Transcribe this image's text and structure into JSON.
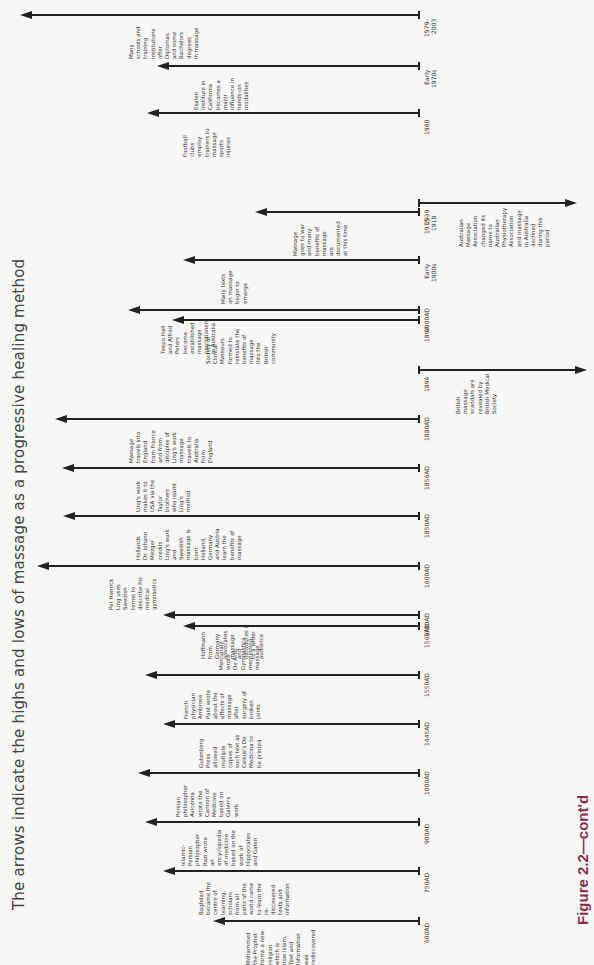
{
  "title": "The arrows indicate the highs and lows of massage as a progressive healing method",
  "figure_label": "Figure 2.2—cont'd",
  "events": [
    {
      "date": "1979–\n2003",
      "direction": "high",
      "y": 15,
      "tip": 20,
      "text": "Many\nschools and\ntraining\ninstitutions\noffer\nDiplomas\nand some\nBachelors\ndegrees\nin massage",
      "nx": 128
    },
    {
      "date": "Early\n1970s",
      "direction": "high",
      "y": 66,
      "tip": 157,
      "text": "Esalen\nInstitute in\nCalifornia\nbecomes a\nmajor\ninfluence in\nhands-on\nmodalities",
      "nx": 193
    },
    {
      "date": "1960",
      "direction": "high",
      "y": 113,
      "tip": 147,
      "text": "Football\nclubs\nemploy\ntrainers to\nmassage\nsports\ninjuries",
      "nx": 182
    },
    {
      "date": "1939",
      "direction": "low",
      "y": 203,
      "tip": 575,
      "text": "Australian\nMassage\nAssociation\nchanged its\nname to\nAustralian\nPhysiotherapy\nAssociation\nand massage\nin Australia\ndeclined\nduring this\nperiod",
      "nx": 458
    },
    {
      "date": "1915–\n1918",
      "direction": "high",
      "y": 212,
      "tip": 255,
      "text": "Massage\ngoes to war\nand many\nbenefits of\nmassage\nare\ndocumented\nat this time",
      "nx": 292
    },
    {
      "date": "Early\n1900s",
      "direction": "high",
      "y": 260,
      "tip": 183,
      "text": "Many texts\non massage\nbegin to\nemerge",
      "nx": 220
    },
    {
      "date": "1900AD",
      "direction": "high",
      "y": 310,
      "tip": 128,
      "text": "Teepo Hall\nand Alfred\nPeters\nbecome\nestablished\nmassage\npractitioners\nin Australia",
      "nx": 160
    },
    {
      "date": "1894",
      "direction": "high",
      "y": 320,
      "tip": 172,
      "text": "Society of\nClinical\nMasseurs\nformed to\nreinstate the\nbenefits of\nmassage\ninto the\nBritish\ncommunity",
      "nx": 205
    },
    {
      "date": "1894",
      "direction": "low",
      "y": 370,
      "tip": 585,
      "text": "British\nmassage\nscandals are\nrevealed by\nBritish Medical\nSociety",
      "nx": 455
    },
    {
      "date": "1880AD",
      "direction": "high",
      "y": 419,
      "tip": 55,
      "text": "Massage\ntravels into\nEngland\nfrom France\nand from\ndisciples of\nLing's work\nmassage\ntravels to\nAustralia\nfrom\nEngland",
      "nx": 128
    },
    {
      "date": "1856AD",
      "direction": "high",
      "y": 468,
      "tip": 62,
      "text": "Ling's work\nmakes it to\nUSA via the\nTaylor\nbrothers\nwho learnt\nLing's\nmethod",
      "nx": 135
    },
    {
      "date": "1850AD",
      "direction": "high",
      "y": 516,
      "tip": 63,
      "text": "Hollands\nDr. Johann\nMezger\ncredits\nLing's work\nand\nSwedish\nmassage is\nborn.\nHolland,\nGermany\nand Austria\nlearn the\nbenefits of\nmassage",
      "nx": 135
    },
    {
      "date": "1600AD",
      "direction": "high",
      "y": 566,
      "tip": 37,
      "text": "Per Henrick\nLing uses\nSwedish\nterms to\ndescribe his\nmedical\ngymnastics",
      "nx": 108
    },
    {
      "date": "1700AD",
      "direction": "high",
      "y": 615,
      "tip": 163,
      "text": "Hoffmann\nfrom\nGermany\nadvocates\nmassage\nand\nintroduces it\nto a wider\naudience",
      "nx": 200
    },
    {
      "date": "1569AD",
      "direction": "high",
      "y": 626,
      "tip": 183,
      "text": "Mercuriale\nwrote\nDe Arte\nGymnastica\nmentioning\nmassage",
      "nx": 218
    },
    {
      "date": "1550AD",
      "direction": "high",
      "y": 675,
      "tip": 145,
      "text": "French\nphysician\nAmbrose\nParé wrote\nabout the\neffects of\nmassage\nafter\nsurgery of\nbroken\njoints",
      "nx": 183
    },
    {
      "date": "1445AD",
      "direction": "high",
      "y": 724,
      "tip": 163,
      "text": "Gutenberg\nPress\nallowed\nmultiple\ncopies of\nsuch text as\nCelsus's De\nMedicina to\nbe printed",
      "nx": 198
    },
    {
      "date": "1000AD",
      "direction": "high",
      "y": 773,
      "tip": 138,
      "text": "Persian\nphilosopher\nAvicenna\nwrote the\nCannon of\nMedicine\nbased on\nGalen's\nwork",
      "nx": 175
    },
    {
      "date": "900AD",
      "direction": "high",
      "y": 822,
      "tip": 145,
      "text": "Islamic-\nPersian\nphilosopher\nRazi wrote\nan\nencyclopedia\nof medicine\nbased on the\nwork of\nHippocrates\nand Galen",
      "nx": 180
    },
    {
      "date": "750AD",
      "direction": "high",
      "y": 871,
      "tip": 163,
      "text": "Baghdad\nbecame the\ncentre of\nlearning;\nscholars\nfrom all\nparts of the\nworld came\nto learn the\nre-\ndiscovered\ntexts and\ninformation",
      "nx": 198
    },
    {
      "date": "600AD",
      "direction": "high",
      "y": 921,
      "tip": 213,
      "text": "Mohammed\nthe Prophet\nforms a new\nreligion\nwhich is\nnow Islam.\nText and\ninformation\nwas\nrediscovered",
      "nx": 245
    }
  ],
  "baseline_x": 419
}
